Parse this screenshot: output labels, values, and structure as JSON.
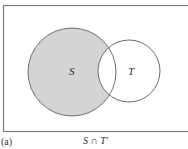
{
  "diagram": {
    "type": "venn",
    "sets": [
      {
        "label": "S",
        "shaded": true
      },
      {
        "label": "T",
        "shaded": false
      }
    ],
    "shaded_region": "S minus T",
    "colors": {
      "shade": "#d4d4d4",
      "stroke": "#6e6e6e",
      "frame": "#7a7a7a"
    }
  },
  "labels": {
    "set_s": "S",
    "set_t": "T"
  },
  "caption": {
    "part": "(a)",
    "expression": "S ∩ T′"
  }
}
